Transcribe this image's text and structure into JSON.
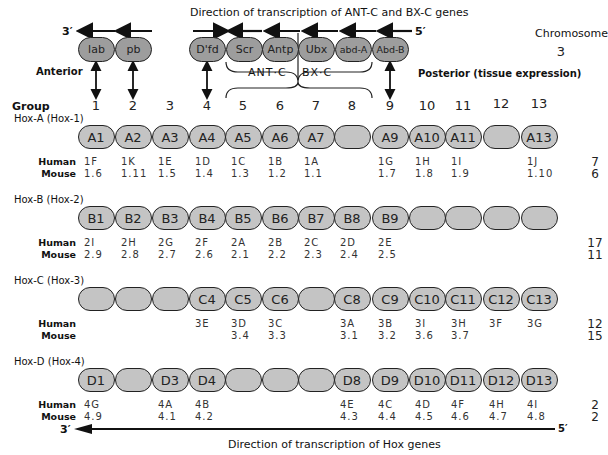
{
  "top_title": "Direction of transcription of ANT-C and BX-C genes",
  "bottom_title": "Direction of transcription of Hox genes",
  "chromosome_header": "Chromosome",
  "anterior_label": "Anterior",
  "posterior_label": "Posterior (tissue expression)",
  "group_label": "Group",
  "prime_3": "3′",
  "prime_5": "5′",
  "ant_c_label": "ANT·C",
  "bx_c_label": "BX·C",
  "fly": {
    "chromosome": "3",
    "genes": [
      {
        "name": "lab",
        "group": 1,
        "direction": "left"
      },
      {
        "name": "pb",
        "group": 2,
        "direction": "left"
      },
      {
        "name": "D'fd",
        "group": 4,
        "direction": "right"
      },
      {
        "name": "Scr",
        "group": 5,
        "direction": "left"
      },
      {
        "name": "Antp",
        "group": 6,
        "direction": "left"
      },
      {
        "name": "Ubx",
        "group": 7,
        "direction": "left"
      },
      {
        "name": "abd-A",
        "group": 8,
        "direction": "left"
      },
      {
        "name": "Abd-B",
        "group": 9,
        "direction": "left"
      }
    ]
  },
  "groups": [
    "1",
    "2",
    "3",
    "4",
    "5",
    "6",
    "7",
    "8",
    "9",
    "10",
    "11",
    "12",
    "13"
  ],
  "row_labels": {
    "human": "Human",
    "mouse": "Mouse"
  },
  "clusters": [
    {
      "name": "Hox-A (Hox-1)",
      "genes": [
        "A1",
        "A2",
        "A3",
        "A4",
        "A5",
        "A6",
        "A7",
        "",
        "A9",
        "A10",
        "A11",
        "",
        "A13"
      ],
      "human": [
        "1F",
        "1K",
        "1E",
        "1D",
        "1C",
        "1B",
        "1A",
        "",
        "1G",
        "1H",
        "1I",
        "",
        "1J"
      ],
      "mouse": [
        "1.6",
        "1.11",
        "1.5",
        "1.4",
        "1.3",
        "1.2",
        "1.1",
        "",
        "1.7",
        "1.8",
        "1.9",
        "",
        "1.10"
      ],
      "chromosome_human": "7",
      "chromosome_mouse": "6"
    },
    {
      "name": "Hox-B (Hox-2)",
      "genes": [
        "B1",
        "B2",
        "B3",
        "B4",
        "B5",
        "B6",
        "B7",
        "B8",
        "B9",
        "",
        "",
        "",
        ""
      ],
      "human": [
        "2I",
        "2H",
        "2G",
        "2F",
        "2A",
        "2B",
        "2C",
        "2D",
        "2E",
        "",
        "",
        "",
        ""
      ],
      "mouse": [
        "2.9",
        "2.8",
        "2.7",
        "2.6",
        "2.1",
        "2.2",
        "2.3",
        "2.4",
        "2.5",
        "",
        "",
        "",
        ""
      ],
      "chromosome_human": "17",
      "chromosome_mouse": "11"
    },
    {
      "name": "Hox-C (Hox-3)",
      "genes": [
        "",
        "",
        "",
        "C4",
        "C5",
        "C6",
        "",
        "C8",
        "C9",
        "C10",
        "C11",
        "C12",
        "C13"
      ],
      "human": [
        "",
        "",
        "",
        "3E",
        "3D",
        "3C",
        "",
        "3A",
        "3B",
        "3I",
        "3H",
        "3F",
        "3G"
      ],
      "mouse": [
        "",
        "",
        "",
        "",
        "3.4",
        "3.3",
        "",
        "3.1",
        "3.2",
        "3.6",
        "3.7",
        "",
        ""
      ],
      "chromosome_human": "12",
      "chromosome_mouse": "15"
    },
    {
      "name": "Hox-D (Hox-4)",
      "genes": [
        "D1",
        "",
        "D3",
        "D4",
        "",
        "",
        "",
        "D8",
        "D9",
        "D10",
        "D11",
        "D12",
        "D13"
      ],
      "human": [
        "4G",
        "",
        "4A",
        "4B",
        "",
        "",
        "",
        "4E",
        "4C",
        "4D",
        "4F",
        "4H",
        "4I"
      ],
      "mouse": [
        "4.9",
        "",
        "4.1",
        "4.2",
        "",
        "",
        "",
        "4.3",
        "4.4",
        "4.5",
        "4.6",
        "4.7",
        "4.8"
      ],
      "chromosome_human": "2",
      "chromosome_mouse": "2"
    }
  ],
  "colors": {
    "fly_gene_fill": "#9d9d9d",
    "hox_gene_fill": "#c4c4c4",
    "outline": "#222222"
  }
}
